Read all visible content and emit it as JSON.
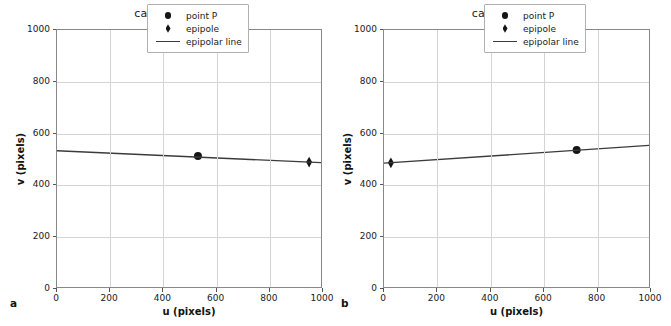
{
  "figure": {
    "width": 671,
    "height": 326,
    "background": "#ffffff"
  },
  "panels": [
    {
      "letter": "a",
      "title": "camera 1",
      "xlabel": "u (pixels)",
      "ylabel": "v (pixels)",
      "xticks": [
        "0",
        "200",
        "400",
        "600",
        "800",
        "1000"
      ],
      "yticks": [
        "0",
        "200",
        "400",
        "600",
        "800",
        "1000"
      ],
      "legend": [
        {
          "label": "point P",
          "marker": "circle-marker"
        },
        {
          "label": "epipole",
          "marker": "diamond-marker"
        },
        {
          "label": "epipolar line",
          "marker": "line-marker"
        }
      ]
    },
    {
      "letter": "b",
      "title": "camera 2",
      "xlabel": "u (pixels)",
      "ylabel": "v (pixels)",
      "xticks": [
        "0",
        "200",
        "400",
        "600",
        "800",
        "1000"
      ],
      "yticks": [
        "0",
        "200",
        "400",
        "600",
        "800",
        "1000"
      ],
      "legend": [
        {
          "label": "point P",
          "marker": "circle-marker"
        },
        {
          "label": "epipole",
          "marker": "diamond-marker"
        },
        {
          "label": "epipolar line",
          "marker": "line-marker"
        }
      ]
    }
  ],
  "chart_data": [
    {
      "type": "scatter",
      "title": "camera 1",
      "xlabel": "u (pixels)",
      "ylabel": "v (pixels)",
      "xlim": [
        0,
        1000
      ],
      "ylim": [
        1000,
        0
      ],
      "y_inverted": true,
      "grid": true,
      "legend_position": "upper right",
      "xticks": [
        0,
        200,
        400,
        600,
        800,
        1000
      ],
      "yticks": [
        0,
        200,
        400,
        600,
        800,
        1000
      ],
      "series": [
        {
          "name": "point P",
          "type": "scatter",
          "marker": "circle",
          "color": "#151515",
          "points": [
            {
              "u": 534,
              "v": 510
            }
          ]
        },
        {
          "name": "epipole",
          "type": "scatter",
          "marker": "diamond",
          "color": "#151515",
          "points": [
            {
              "u": 955,
              "v": 486
            }
          ]
        },
        {
          "name": "epipolar line",
          "type": "line",
          "color": "#3b3b3b",
          "points": [
            {
              "u": 0,
              "v": 530
            },
            {
              "u": 1000,
              "v": 484
            }
          ]
        }
      ]
    },
    {
      "type": "scatter",
      "title": "camera 2",
      "xlabel": "u (pixels)",
      "ylabel": "v (pixels)",
      "xlim": [
        0,
        1000
      ],
      "ylim": [
        1000,
        0
      ],
      "y_inverted": true,
      "grid": true,
      "legend_position": "upper right",
      "xticks": [
        0,
        200,
        400,
        600,
        800,
        1000
      ],
      "yticks": [
        0,
        200,
        400,
        600,
        800,
        1000
      ],
      "series": [
        {
          "name": "point P",
          "type": "scatter",
          "marker": "circle",
          "color": "#151515",
          "points": [
            {
              "u": 727,
              "v": 533
            }
          ]
        },
        {
          "name": "epipole",
          "type": "scatter",
          "marker": "diamond",
          "color": "#151515",
          "points": [
            {
              "u": 26,
              "v": 483
            }
          ]
        },
        {
          "name": "epipolar line",
          "type": "line",
          "color": "#3b3b3b",
          "points": [
            {
              "u": 0,
              "v": 482
            },
            {
              "u": 1000,
              "v": 551
            }
          ]
        }
      ]
    }
  ]
}
